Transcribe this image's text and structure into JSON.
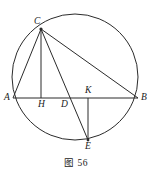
{
  "figure": {
    "caption": "图 56",
    "stroke_color": "#2b2b2b",
    "background_color": "#ffffff",
    "label_color": "#1a1a1a"
  },
  "chart_data": {
    "type": "diagram",
    "title": "图 56",
    "circle": {
      "cx": 75,
      "cy": 77,
      "r": 63
    },
    "points": [
      {
        "name": "C",
        "x": 41,
        "y": 29,
        "on_circle": true,
        "label_dx": -7,
        "label_dy": -12
      },
      {
        "name": "A",
        "x": 13,
        "y": 98,
        "on_circle": true,
        "label_dx": -9,
        "label_dy": -5
      },
      {
        "name": "B",
        "x": 138,
        "y": 98,
        "on_circle": true,
        "label_dx": 3,
        "label_dy": -5
      },
      {
        "name": "H",
        "x": 41,
        "y": 98,
        "on_circle": false,
        "label_dx": -3,
        "label_dy": 2
      },
      {
        "name": "D",
        "x": 64,
        "y": 98,
        "on_circle": false,
        "label_dx": -3,
        "label_dy": 2
      },
      {
        "name": "K",
        "x": 88,
        "y": 98,
        "on_circle": false,
        "label_dx": -3,
        "label_dy": -12
      },
      {
        "name": "E",
        "x": 88,
        "y": 140,
        "on_circle": true,
        "label_dx": -3,
        "label_dy": 2
      }
    ],
    "segments": [
      {
        "from": "A",
        "to": "B",
        "name": "chord-ab"
      },
      {
        "from": "C",
        "to": "A",
        "name": "segment-ca"
      },
      {
        "from": "C",
        "to": "H",
        "name": "segment-ch"
      },
      {
        "from": "C",
        "to": "E",
        "name": "segment-ce"
      },
      {
        "from": "C",
        "to": "B",
        "name": "segment-cb"
      },
      {
        "from": "K",
        "to": "E",
        "name": "segment-ke"
      }
    ],
    "labels": [
      "A",
      "B",
      "C",
      "D",
      "E",
      "H",
      "K"
    ]
  },
  "labels": {
    "A": "A",
    "B": "B",
    "C": "C",
    "D": "D",
    "E": "E",
    "H": "H",
    "K": "K"
  }
}
